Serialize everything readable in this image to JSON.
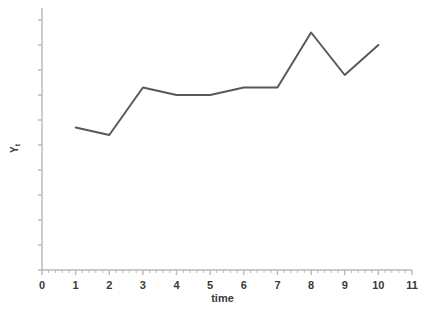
{
  "chart_data": {
    "type": "line",
    "title": "",
    "xlabel": "time",
    "ylabel": "Y_t",
    "ylabel_base": "Y",
    "ylabel_sub": "t",
    "x": [
      1,
      2,
      3,
      4,
      5,
      6,
      7,
      8,
      9,
      10
    ],
    "values": [
      5.7,
      5.4,
      7.3,
      7.0,
      7.0,
      7.3,
      7.3,
      9.5,
      7.8,
      9.0
    ],
    "series": [
      {
        "name": "Y_t",
        "values": [
          5.7,
          5.4,
          7.3,
          7.0,
          7.0,
          7.3,
          7.3,
          9.5,
          7.8,
          9.0
        ]
      }
    ],
    "xlim": [
      0,
      11
    ],
    "ylim": [
      0,
      10
    ],
    "x_tick_labels": [
      "0",
      "1",
      "2",
      "3",
      "4",
      "5",
      "6",
      "7",
      "8",
      "9",
      "10",
      "11"
    ],
    "x_tick_values": [
      0,
      1,
      2,
      3,
      4,
      5,
      6,
      7,
      8,
      9,
      10,
      11
    ],
    "x_minor_ticks_per_major": 5,
    "y_tick_labels": [],
    "y_tick_count": 11,
    "grid": false,
    "legend": false,
    "legend_position": "none",
    "line_color": "#595959",
    "axis_color": "#b8b8b8",
    "text_color": "#3a3a3a",
    "markers": false,
    "line_width": 2
  }
}
